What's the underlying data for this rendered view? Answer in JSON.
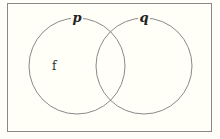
{
  "diagram": {
    "type": "venn",
    "sets": [
      {
        "label": "p",
        "cx": 77,
        "cy": 66,
        "r": 48
      },
      {
        "label": "q",
        "cx": 144,
        "cy": 66,
        "r": 48
      }
    ],
    "elements": [
      {
        "label": "f",
        "region": "p only",
        "x": 52,
        "y": 70
      }
    ],
    "colors": {
      "stroke": "#8a8a8a",
      "background": "#fffef7"
    }
  }
}
